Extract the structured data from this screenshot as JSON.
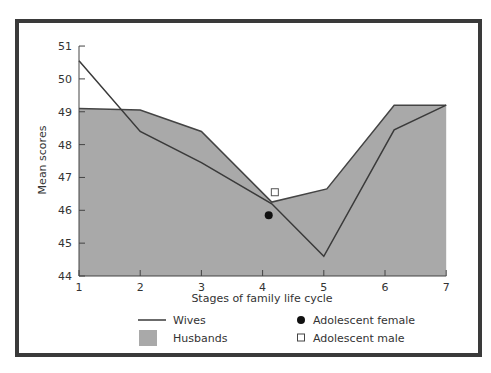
{
  "chart_data": {
    "type": "area",
    "title": "",
    "xlabel": "Stages of family life cycle",
    "ylabel": "Mean scores",
    "x": [
      1,
      2,
      3,
      4,
      5,
      6,
      7
    ],
    "x_tick_labels": [
      "1",
      "2",
      "3",
      "4",
      "5",
      "6",
      "7"
    ],
    "y_tick_labels": [
      "44",
      "45",
      "46",
      "47",
      "48",
      "49",
      "50",
      "51"
    ],
    "ylim": [
      44,
      51
    ],
    "xlim": [
      1,
      7
    ],
    "grid": false,
    "legend_position": "bottom",
    "series": [
      {
        "name": "Husbands",
        "style": "filled-area",
        "color": "#a9a9a9",
        "points": [
          [
            1,
            49.1
          ],
          [
            2,
            49.05
          ],
          [
            3,
            48.4
          ],
          [
            4.15,
            46.25
          ],
          [
            5.05,
            46.65
          ],
          [
            6.15,
            49.2
          ],
          [
            7,
            49.2
          ]
        ]
      },
      {
        "name": "Wives",
        "style": "line",
        "color": "#3a3a3a",
        "points": [
          [
            1,
            50.55
          ],
          [
            2,
            48.4
          ],
          [
            3,
            47.45
          ],
          [
            4.15,
            46.2
          ],
          [
            5,
            44.6
          ],
          [
            6.15,
            48.45
          ],
          [
            7,
            49.2
          ]
        ]
      },
      {
        "name": "Adolescent female",
        "style": "marker-filled-circle",
        "color": "#111111",
        "points": [
          [
            4.1,
            45.85
          ]
        ]
      },
      {
        "name": "Adolescent male",
        "style": "marker-open-square",
        "color": "#555555",
        "points": [
          [
            4.2,
            46.55
          ]
        ]
      }
    ]
  },
  "legend": {
    "wives": "Wives",
    "husbands": "Husbands",
    "female": "Adolescent female",
    "male": "Adolescent male"
  },
  "axes": {
    "xlabel": "Stages of family life cycle",
    "ylabel": "Mean scores"
  }
}
